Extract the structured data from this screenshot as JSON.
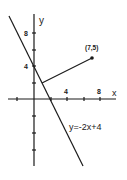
{
  "diagram": {
    "axes": {
      "x_label": "x",
      "y_label": "y",
      "x_tick_labels": [
        "4",
        "8"
      ],
      "y_tick_labels": [
        "4",
        "8"
      ],
      "x_ticks": [
        -2,
        2,
        4,
        6,
        8
      ],
      "y_ticks": [
        -8,
        -6,
        -4,
        -2,
        2,
        4,
        6,
        8
      ]
    },
    "line": {
      "equation_label": "y=-2x+4",
      "slope": -2,
      "intercept": 4
    },
    "point": {
      "label": "(7,5)",
      "x": 7,
      "y": 5
    },
    "perpendicular_foot": {
      "x": 1,
      "y": 2
    },
    "colors": {
      "ink": "#1a1a1a",
      "background": "#ffffff"
    }
  }
}
